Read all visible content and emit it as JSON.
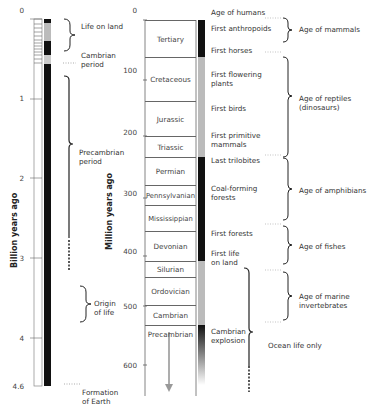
{
  "left_scale": {
    "axis_title": "Billion years ago",
    "ticks": [
      {
        "label": "0",
        "y": 10
      },
      {
        "label": "1",
        "y": 98
      },
      {
        "label": "2",
        "y": 178
      },
      {
        "label": "3",
        "y": 258
      },
      {
        "label": "4",
        "y": 338
      },
      {
        "label": "4.6",
        "y": 386
      }
    ],
    "annotations": [
      {
        "label": "Life on land",
        "y": 22
      },
      {
        "label": "Cambrian\nperiod",
        "y": 52
      },
      {
        "label": "Precambrian\nperiod",
        "y": 150
      },
      {
        "label": "Origin\nof life",
        "y": 306
      },
      {
        "label": "Formation\nof Earth",
        "y": 386
      }
    ]
  },
  "right_scale": {
    "axis_title": "Million years ago",
    "ticks": [
      {
        "label": "0",
        "y": 10
      },
      {
        "label": "100",
        "y": 72
      },
      {
        "label": "200",
        "y": 132
      },
      {
        "label": "300",
        "y": 193
      },
      {
        "label": "400",
        "y": 254
      },
      {
        "label": "500",
        "y": 309
      },
      {
        "label": "600",
        "y": 371
      }
    ],
    "periods": [
      {
        "name": "Tertiary",
        "top": 20,
        "bottom": 57
      },
      {
        "name": "Cretaceous",
        "top": 57,
        "bottom": 101
      },
      {
        "name": "Jurassic",
        "top": 101,
        "bottom": 136
      },
      {
        "name": "Triassic",
        "top": 136,
        "bottom": 157
      },
      {
        "name": "Permian",
        "top": 157,
        "bottom": 185
      },
      {
        "name": "Pennsylvanian",
        "top": 185,
        "bottom": 205
      },
      {
        "name": "Mississippian",
        "top": 205,
        "bottom": 231
      },
      {
        "name": "Devonian",
        "top": 231,
        "bottom": 261
      },
      {
        "name": "Silurian",
        "top": 261,
        "bottom": 277
      },
      {
        "name": "Ordovician",
        "top": 277,
        "bottom": 305
      },
      {
        "name": "Cambrian",
        "top": 305,
        "bottom": 325
      },
      {
        "name": "Precambrian",
        "top": 325,
        "bottom": 396
      }
    ],
    "events": [
      {
        "label": "Age of humans",
        "y": 12
      },
      {
        "label": "First anthropoids",
        "y": 28
      },
      {
        "label": "First horses",
        "y": 50
      },
      {
        "label": "First flowering\nplants",
        "y": 73
      },
      {
        "label": "First birds",
        "y": 108
      },
      {
        "label": "First primitive\nmammals",
        "y": 134
      },
      {
        "label": "Last trilobites",
        "y": 160
      },
      {
        "label": "Coal-forming\nforests",
        "y": 188
      },
      {
        "label": "First forests",
        "y": 232
      },
      {
        "label": "First life\non land",
        "y": 252
      },
      {
        "label": "Cambrian\nexplosion",
        "y": 330
      }
    ],
    "ages": [
      {
        "label": "Age of mammals",
        "y": 28
      },
      {
        "label": "Age of reptiles\n(dinosaurs)",
        "y": 98
      },
      {
        "label": "Age of amphibians",
        "y": 190
      },
      {
        "label": "Age of fishes",
        "y": 246
      },
      {
        "label": "Age of marine\ninvertebrates",
        "y": 296
      },
      {
        "label": "Ocean life only",
        "y": 344
      }
    ]
  }
}
